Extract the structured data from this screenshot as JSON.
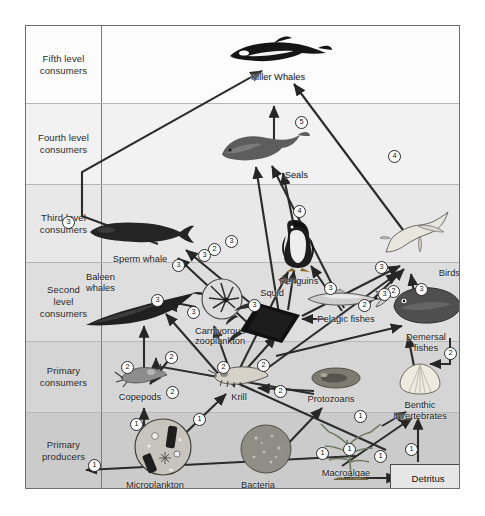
{
  "figure": {
    "type": "trophic-level food web diagram",
    "frame": {
      "left": 25,
      "top": 25,
      "width": 435,
      "height": 464
    }
  },
  "trophic_levels": [
    {
      "id": "fifth",
      "label": "Fifth level\nconsumers",
      "label_line1": "Fifth level",
      "label_line2": "consumers",
      "top": 0,
      "height": 78,
      "bg": "#fcfcfc"
    },
    {
      "id": "fourth",
      "label": "Fourth level\nconsumers",
      "label_line1": "Fourth level",
      "label_line2": "consumers",
      "top": 78,
      "height": 81,
      "bg": "#f2f2f2"
    },
    {
      "id": "third",
      "label": "Third level\nconsumers",
      "label_line1": "Third level",
      "label_line2": "consumers",
      "top": 159,
      "height": 78,
      "bg": "#e8e8e8"
    },
    {
      "id": "second",
      "label": "Second\nlevel\nconsumers",
      "label_line1": "Second",
      "label_line2": "level",
      "label_line3": "consumers",
      "top": 237,
      "height": 79,
      "bg": "#dedede"
    },
    {
      "id": "primary_consumers",
      "label": "Primary\nconsumers",
      "label_line1": "Primary",
      "label_line2": "consumers",
      "top": 316,
      "height": 71,
      "bg": "#d5d5d5"
    },
    {
      "id": "primary_producers",
      "label": "Primary\nproducers",
      "label_line1": "Primary",
      "label_line2": "producers",
      "top": 387,
      "height": 77,
      "bg": "#cbcbcb"
    }
  ],
  "organisms": [
    {
      "id": "killer_whales",
      "label": "Killer Whales",
      "level": "fifth",
      "x": 251,
      "y": 42,
      "art": "orca"
    },
    {
      "id": "seals",
      "label": "Seals",
      "level": "fourth",
      "x": 233,
      "y": 130,
      "art": "seal"
    },
    {
      "id": "sperm_whale",
      "label": "Sperm whale",
      "level": "third",
      "x": 113,
      "y": 213,
      "art": "sperm-whale"
    },
    {
      "id": "penguins",
      "label": "Penguins",
      "level": "third",
      "x": 272,
      "y": 228,
      "art": "penguin"
    },
    {
      "id": "birds",
      "label": "Birds",
      "level": "third",
      "x": 404,
      "y": 232,
      "art": "bird"
    },
    {
      "id": "baleen_whales",
      "label": "Baleen\nwhales",
      "label_line1": "Baleen",
      "label_line2": "whales",
      "level": "second",
      "x": 98,
      "y": 262,
      "art": "baleen-whale"
    },
    {
      "id": "carnivorous_zooplankton",
      "label": "Carnivorous\nzooplankton",
      "label_line1": "Carnivorous",
      "label_line2": "zooplankton",
      "level": "second",
      "x": 192,
      "y": 288,
      "art": "zooplankton-circle"
    },
    {
      "id": "squid",
      "label": "Squid",
      "level": "second",
      "x": 258,
      "y": 297,
      "art": "squid"
    },
    {
      "id": "pelagic_fishes",
      "label": "Pelagic fishes",
      "level": "second",
      "x": 320,
      "y": 293,
      "art": "pelagic-fish"
    },
    {
      "id": "demersal_fishes",
      "label": "Demersal\nfishes",
      "label_line1": "Demersal",
      "label_line2": "fishes",
      "level": "second",
      "x": 400,
      "y": 300,
      "art": "demersal-fish"
    },
    {
      "id": "copepods",
      "label": "Copepods",
      "level": "primary_consumers",
      "x": 112,
      "y": 365,
      "art": "copepod"
    },
    {
      "id": "krill",
      "label": "Krill",
      "level": "primary_consumers",
      "x": 213,
      "y": 363,
      "art": "krill"
    },
    {
      "id": "protozoans",
      "label": "Protozoans",
      "level": "primary_consumers",
      "x": 305,
      "y": 368,
      "art": "protozoan"
    },
    {
      "id": "benthic_invertebrates",
      "label": "Benthic\ninvertebrates",
      "label_line1": "Benthic",
      "label_line2": "invertebrates",
      "level": "primary_consumers",
      "x": 398,
      "y": 372,
      "art": "bivalve"
    },
    {
      "id": "microplankton",
      "label": "Microplankton",
      "level": "primary_producers",
      "x": 128,
      "y": 440,
      "art": "microplankton-circle"
    },
    {
      "id": "bacteria",
      "label": "Bacteria",
      "level": "primary_producers",
      "x": 232,
      "y": 440,
      "art": "bacteria-blob"
    },
    {
      "id": "macroalgae",
      "label": "Macroalgae",
      "level": "primary_producers",
      "x": 324,
      "y": 450,
      "art": "macroalga"
    },
    {
      "id": "detritus",
      "label": "Detritus",
      "level": "primary_producers",
      "x": 400,
      "y": 450,
      "art": "box"
    }
  ],
  "link_numbers": [
    {
      "value": "1",
      "x": 110,
      "y": 398
    },
    {
      "value": "1",
      "x": 173,
      "y": 393
    },
    {
      "value": "1",
      "x": 296,
      "y": 427
    },
    {
      "value": "1",
      "x": 323,
      "y": 423
    },
    {
      "value": "1",
      "x": 354,
      "y": 430
    },
    {
      "value": "1",
      "x": 385,
      "y": 423
    },
    {
      "value": "1",
      "x": 68,
      "y": 439
    },
    {
      "value": "1",
      "x": 334,
      "y": 390
    },
    {
      "value": "2",
      "x": 101,
      "y": 341
    },
    {
      "value": "2",
      "x": 145,
      "y": 331
    },
    {
      "value": "2",
      "x": 197,
      "y": 341
    },
    {
      "value": "2",
      "x": 237,
      "y": 339
    },
    {
      "value": "2",
      "x": 146,
      "y": 366
    },
    {
      "value": "2",
      "x": 254,
      "y": 365
    },
    {
      "value": "2",
      "x": 338,
      "y": 279
    },
    {
      "value": "2",
      "x": 367,
      "y": 265
    },
    {
      "value": "2",
      "x": 424,
      "y": 327
    },
    {
      "value": "2",
      "x": 188,
      "y": 223
    },
    {
      "value": "3",
      "x": 42,
      "y": 196
    },
    {
      "value": "3",
      "x": 131,
      "y": 274
    },
    {
      "value": "3",
      "x": 167,
      "y": 286
    },
    {
      "value": "3",
      "x": 178,
      "y": 229
    },
    {
      "value": "3",
      "x": 205,
      "y": 215
    },
    {
      "value": "3",
      "x": 152,
      "y": 239
    },
    {
      "value": "3",
      "x": 228,
      "y": 279
    },
    {
      "value": "3",
      "x": 304,
      "y": 262
    },
    {
      "value": "3",
      "x": 355,
      "y": 241
    },
    {
      "value": "3",
      "x": 358,
      "y": 268
    },
    {
      "value": "3",
      "x": 395,
      "y": 263
    },
    {
      "value": "4",
      "x": 273,
      "y": 185
    },
    {
      "value": "4",
      "x": 368,
      "y": 130
    },
    {
      "value": "5",
      "x": 275,
      "y": 96
    }
  ]
}
